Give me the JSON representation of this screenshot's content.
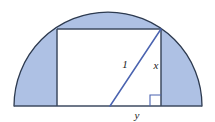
{
  "figure": {
    "kind": "geometry-diagram",
    "background_color": "#ffffff",
    "shaded_fill_color": "#aec1e4",
    "outline_color": "#2d3a4f",
    "diagonal_color": "#4a63b0",
    "unshaded_fill_color": "#ffffff",
    "semicircle": {
      "center_x": 108,
      "center_y": 106,
      "radius": 94,
      "left_x": 14,
      "right_x": 202,
      "top_y": 12,
      "baseline_y": 106
    },
    "rectangle": {
      "left_x": 57,
      "right_x": 161,
      "top_y": 29,
      "bottom_y": 106
    },
    "diagonal": {
      "x1": 110,
      "y1": 106,
      "x2": 161,
      "y2": 29
    },
    "right_angle_marker": {
      "corner_x": 161,
      "corner_y": 106,
      "size": 11
    },
    "labels": {
      "hypotenuse": "1",
      "vertical_leg": "x",
      "horizontal_leg": "y"
    },
    "label_positions": {
      "hypotenuse": {
        "x": 125,
        "y": 68
      },
      "vertical_leg": {
        "x": 156,
        "y": 69
      },
      "horizontal_leg": {
        "x": 137,
        "y": 119
      }
    }
  }
}
